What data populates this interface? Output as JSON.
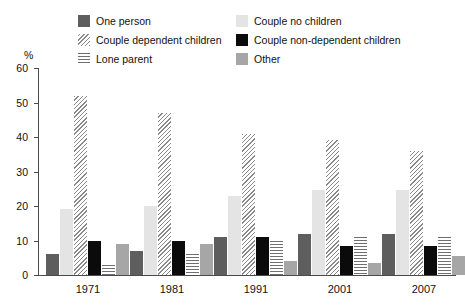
{
  "chart_data": {
    "type": "bar",
    "title": "",
    "xlabel": "",
    "ylabel": "%",
    "ylim": [
      0,
      60
    ],
    "yticks": [
      0,
      10,
      20,
      30,
      40,
      50,
      60
    ],
    "grid": false,
    "legend_position": "top",
    "categories": [
      "1971",
      "1981",
      "1991",
      "2001",
      "2007"
    ],
    "series": [
      {
        "name": "One person",
        "key": "one-person",
        "color": "#5e5e5e",
        "pattern": "solid",
        "values": [
          6,
          7,
          11,
          12,
          12
        ]
      },
      {
        "name": "Couple no children",
        "key": "couple-no",
        "color": "#e4e4e4",
        "pattern": "solid",
        "values": [
          19,
          20,
          23,
          24.5,
          24.5
        ]
      },
      {
        "name": "Couple dependent children",
        "key": "couple-dep",
        "color": "#8a8a8a",
        "pattern": "diagonal-hatch",
        "values": [
          52,
          47,
          41,
          39,
          36
        ]
      },
      {
        "name": "Couple non-dependent children",
        "key": "couple-nondep",
        "color": "#0b0b0b",
        "pattern": "solid",
        "values": [
          10,
          10,
          11,
          8.5,
          8.5
        ]
      },
      {
        "name": "Lone parent",
        "key": "lone-parent",
        "color": "#6f6f6f",
        "pattern": "horizontal-hatch",
        "values": [
          3,
          6,
          10,
          11,
          11
        ]
      },
      {
        "name": "Other",
        "key": "other",
        "color": "#a6a6a6",
        "pattern": "solid",
        "values": [
          9,
          9,
          4,
          3.5,
          5.5
        ]
      }
    ]
  }
}
